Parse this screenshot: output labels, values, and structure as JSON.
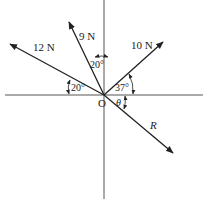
{
  "diagram": {
    "type": "force-vector-diagram",
    "origin_label": "O",
    "axes": {
      "horizontal": true,
      "vertical": true
    },
    "colors": {
      "line": "#222222",
      "axis": "#555555",
      "background": "#ffffff"
    },
    "forces": [
      {
        "id": "f9",
        "label": "9 N",
        "magnitude": 9,
        "unit": "N",
        "angle_desc": "20° from vertical, toward left"
      },
      {
        "id": "f12",
        "label": "12 N",
        "magnitude": 12,
        "unit": "N",
        "angle_desc": "20° above horizontal, left"
      },
      {
        "id": "f10",
        "label": "10 N",
        "magnitude": 10,
        "unit": "N",
        "angle_desc": "37° above horizontal, right"
      },
      {
        "id": "R",
        "label": "R",
        "magnitude": null,
        "unit": "",
        "angle_desc": "θ below horizontal, right"
      }
    ],
    "angles": [
      {
        "id": "a9",
        "label": "20°"
      },
      {
        "id": "a12",
        "label": "20°"
      },
      {
        "id": "a10",
        "label": "37°"
      },
      {
        "id": "aR",
        "label": "θ"
      }
    ]
  }
}
